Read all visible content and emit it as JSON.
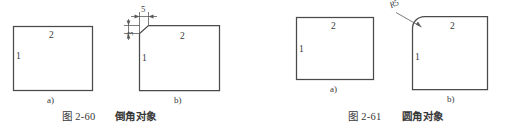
{
  "figures": [
    {
      "id": "fig-2-60",
      "caption_number": "图 2-60",
      "caption_title": "倒角对象",
      "panels": [
        {
          "label": "a)",
          "shape": "rectangle",
          "edge_labels": {
            "left": "1",
            "top": "2"
          }
        },
        {
          "label": "b)",
          "shape": "chamfered-rectangle",
          "edge_labels": {
            "left": "1",
            "top": "2"
          },
          "dimensions": [
            {
              "name": "chamfer-horizontal-distance",
              "value": "5",
              "orientation": "horizontal"
            },
            {
              "name": "chamfer-vertical-distance",
              "value": "3",
              "orientation": "vertical"
            }
          ]
        }
      ]
    },
    {
      "id": "fig-2-61",
      "caption_number": "图 2-61",
      "caption_title": "圆角对象",
      "panels": [
        {
          "label": "a)",
          "shape": "rectangle",
          "edge_labels": {
            "left": "1",
            "top": "2"
          }
        },
        {
          "label": "b)",
          "shape": "filleted-rectangle",
          "edge_labels": {
            "left": "1",
            "top": "2"
          },
          "dimensions": [
            {
              "name": "fillet-radius",
              "value": "R5",
              "orientation": "leader"
            }
          ]
        }
      ]
    }
  ],
  "colors": {
    "background": "#ffffff",
    "line": "#4a4a4a",
    "thin_line": "#5a5a5a",
    "text": "#383838"
  }
}
